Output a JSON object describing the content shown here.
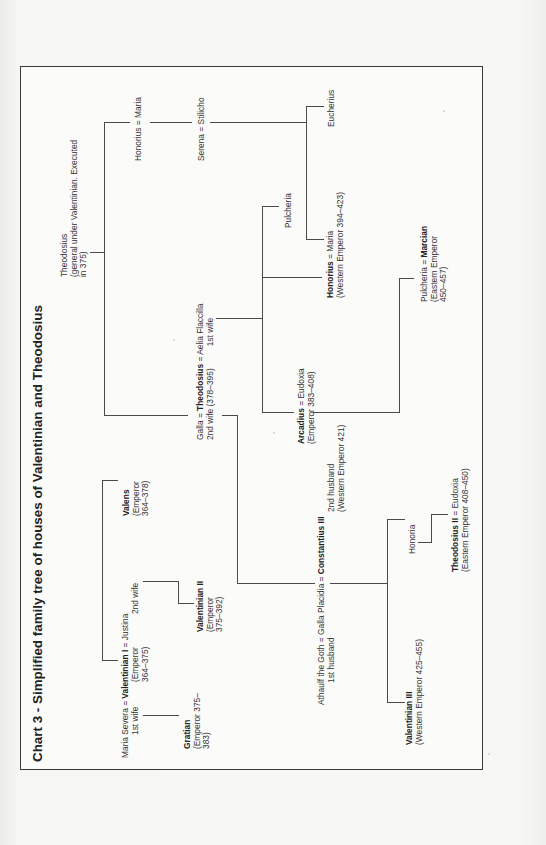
{
  "title": "Chart 3 - Simplified family tree of houses of Valentinian and Theodosius",
  "nodes": {
    "theodosius_elder": {
      "line1": "Theodosius",
      "line2": "(general under Valentinian. Executed",
      "line3": "in 375)"
    },
    "honorius_maria_elder": {
      "a": "Honorius",
      "eq": " = ",
      "b": "Maria"
    },
    "serena_stilicho": {
      "a": "Serena",
      "eq": " = ",
      "b": "Stilicho"
    },
    "eucherius": {
      "name": "Eucherius"
    },
    "pulcheria_sister": {
      "name": "Pulcheria"
    },
    "honorius_emperor": {
      "a": "Honorius",
      "eq": " = ",
      "b": "Maria",
      "line2": "(Western Emperor 394–423)"
    },
    "theodosius_great": {
      "a": "Galla",
      "eq1": " = ",
      "b": "Theodosius",
      "eq2": " = ",
      "c": "Aelia Flaccilla",
      "line2_left": "2nd wife (378–395)",
      "line2_right": "1st wife"
    },
    "arcadius": {
      "a": "Arcadius",
      "eq": " = ",
      "b": "Eudoxia",
      "line2": "(Emperor 383–408)"
    },
    "pulcheria_marcian": {
      "a": "Pulcheria",
      "eq": " = ",
      "b": "Marcian",
      "line2": "(Eastern Emperor",
      "line3": "450–457)"
    },
    "valens": {
      "name": "Valens",
      "line2": "(Emperor",
      "line3": "364–378)"
    },
    "valentinian_i": {
      "a": "Maria Severa",
      "eq1": " = ",
      "b": "Valentinian I",
      "eq2": " = ",
      "c": "Justina",
      "a_sub": "1st wife",
      "b_sub1": "(Emperor",
      "b_sub2": "364–375)",
      "c_sub": "2nd wife"
    },
    "gratian": {
      "name": "Gratian",
      "line2": "(Emperor 375–",
      "line3": "383)"
    },
    "valentinian_ii": {
      "name": "Valentinian II",
      "line2": "(Emperor",
      "line3": "375–392)"
    },
    "galla_placidia": {
      "a": "Athaulf the Goth",
      "eq1": " = ",
      "b": "Galla Placidia",
      "eq2": " = ",
      "c": "Constantius III",
      "a_sub": "1st husband",
      "c_sub1": "2nd husband",
      "c_sub2": "(Western Emperor 421)"
    },
    "valentinian_iii": {
      "name": "Valentinian III",
      "line2": "(Western Emperor 425–455)"
    },
    "honoria": {
      "name": "Honoria"
    },
    "theodosius_ii": {
      "a": "Theodosius II",
      "eq": " = ",
      "b": "Eudoxia",
      "line2": "(Eastern Emperor 408–450)"
    }
  },
  "colors": {
    "line": "#4a4a4a",
    "frame": "#3a3a3a",
    "text": "#333333",
    "paper": "#fbfbfa"
  }
}
